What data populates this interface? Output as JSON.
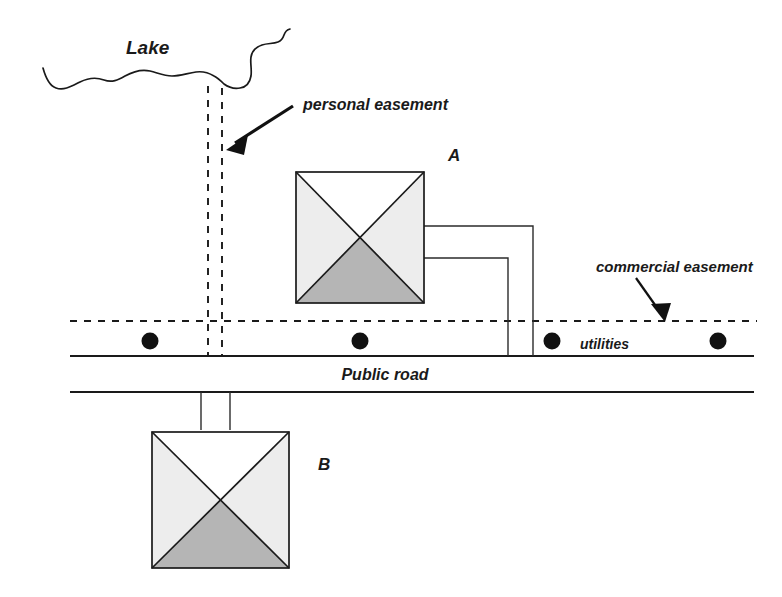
{
  "diagram": {
    "labels": {
      "lake": "Lake",
      "personal_easement": "personal easement",
      "commercial_easement": "commercial easement",
      "utilities": "utilities",
      "public_road": "Public road",
      "house_a": "A",
      "house_b": "B"
    },
    "colors": {
      "ink": "#1a1a1a",
      "roof_light": "#ededed",
      "roof_white": "#ffffff",
      "roof_shaded": "#b5b5b5",
      "background": "#ffffff"
    },
    "elements": {
      "lake_shore": "wavy-shoreline",
      "personal_easement_strip": "two-vertical-dashed-lines",
      "commercial_easement_line": "horizontal-dashed-line",
      "utility_poles_count": 4,
      "house_a_driveways": 2,
      "house_b_driveway": 1
    }
  }
}
